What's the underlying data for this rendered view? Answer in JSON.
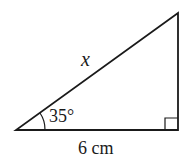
{
  "diagram": {
    "type": "right-triangle",
    "labels": {
      "hypotenuse": "x",
      "angle": "35°",
      "base": "6 cm"
    },
    "right_angle_marker": true,
    "stroke_color": "#1a1a1a"
  }
}
